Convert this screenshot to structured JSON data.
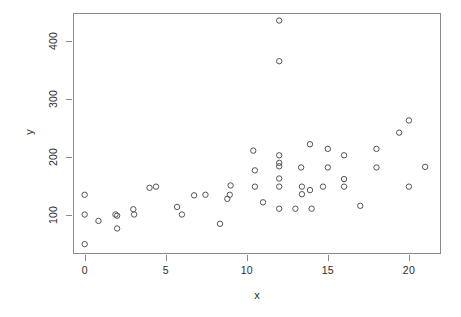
{
  "chart_data": {
    "type": "scatter",
    "title": "",
    "xlabel": "x",
    "ylabel": "y",
    "xlim": [
      -0.72,
      21.98
    ],
    "ylim": [
      33.0,
      448.0
    ],
    "grid": false,
    "legend": false,
    "marker": "open-circle",
    "marker_color": "#545454",
    "x_ticks": [
      0,
      5,
      10,
      15,
      20
    ],
    "x_tick_labels": [
      "0",
      "5",
      "10",
      "15",
      "20"
    ],
    "y_ticks": [
      100,
      200,
      300,
      400
    ],
    "y_tick_labels": [
      "100",
      "200",
      "300",
      "400"
    ],
    "points": [
      {
        "x": 0.0,
        "y": 135
      },
      {
        "x": 0.0,
        "y": 101
      },
      {
        "x": 0.0,
        "y": 50
      },
      {
        "x": 0.85,
        "y": 90
      },
      {
        "x": 1.9,
        "y": 101
      },
      {
        "x": 2.0,
        "y": 99
      },
      {
        "x": 2.0,
        "y": 77
      },
      {
        "x": 3.0,
        "y": 110
      },
      {
        "x": 3.05,
        "y": 101
      },
      {
        "x": 4.0,
        "y": 147
      },
      {
        "x": 4.4,
        "y": 149
      },
      {
        "x": 5.7,
        "y": 114
      },
      {
        "x": 6.0,
        "y": 101
      },
      {
        "x": 6.75,
        "y": 134
      },
      {
        "x": 7.45,
        "y": 135
      },
      {
        "x": 8.35,
        "y": 85
      },
      {
        "x": 8.8,
        "y": 128
      },
      {
        "x": 8.95,
        "y": 135
      },
      {
        "x": 9.0,
        "y": 151
      },
      {
        "x": 10.4,
        "y": 211
      },
      {
        "x": 10.5,
        "y": 177
      },
      {
        "x": 10.5,
        "y": 149
      },
      {
        "x": 11.0,
        "y": 122
      },
      {
        "x": 12.0,
        "y": 435
      },
      {
        "x": 12.0,
        "y": 365
      },
      {
        "x": 12.0,
        "y": 203
      },
      {
        "x": 12.0,
        "y": 190
      },
      {
        "x": 12.0,
        "y": 184
      },
      {
        "x": 12.0,
        "y": 163
      },
      {
        "x": 12.0,
        "y": 149
      },
      {
        "x": 12.0,
        "y": 111
      },
      {
        "x": 13.0,
        "y": 111
      },
      {
        "x": 13.35,
        "y": 182
      },
      {
        "x": 13.4,
        "y": 149
      },
      {
        "x": 13.4,
        "y": 136
      },
      {
        "x": 13.9,
        "y": 222
      },
      {
        "x": 13.9,
        "y": 143
      },
      {
        "x": 14.0,
        "y": 111
      },
      {
        "x": 14.7,
        "y": 149
      },
      {
        "x": 15.0,
        "y": 214
      },
      {
        "x": 15.0,
        "y": 182
      },
      {
        "x": 16.0,
        "y": 203
      },
      {
        "x": 16.0,
        "y": 162
      },
      {
        "x": 16.0,
        "y": 149
      },
      {
        "x": 17.0,
        "y": 116
      },
      {
        "x": 18.0,
        "y": 214
      },
      {
        "x": 18.0,
        "y": 182
      },
      {
        "x": 19.4,
        "y": 242
      },
      {
        "x": 20.0,
        "y": 263
      },
      {
        "x": 20.0,
        "y": 149
      },
      {
        "x": 21.0,
        "y": 183
      }
    ]
  }
}
